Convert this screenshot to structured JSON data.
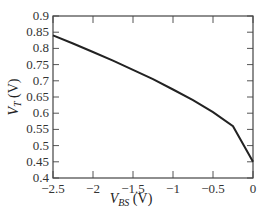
{
  "chart_data": {
    "type": "line",
    "title": "",
    "xlabel": "V_BS (V)",
    "ylabel": "V_T (V)",
    "xlim": [
      -2.5,
      0
    ],
    "ylim": [
      0.4,
      0.9
    ],
    "grid": false,
    "legend": null,
    "x_ticks": [
      "-2.5",
      "-2",
      "-1.5",
      "-1",
      "-0.5",
      "0"
    ],
    "y_ticks": [
      "0.4",
      "0.45",
      "0.5",
      "0.55",
      "0.6",
      "0.65",
      "0.7",
      "0.75",
      "0.8",
      "0.85",
      "0.9"
    ],
    "series": [
      {
        "name": "V_T",
        "x": [
          -2.5,
          -2.25,
          -2.0,
          -1.75,
          -1.5,
          -1.25,
          -1.0,
          -0.75,
          -0.5,
          -0.25,
          0
        ],
        "values": [
          0.84,
          0.815,
          0.789,
          0.762,
          0.734,
          0.705,
          0.673,
          0.64,
          0.603,
          0.56,
          0.45
        ]
      }
    ]
  },
  "axes": {
    "x_label_main": "V",
    "x_label_sub": "BS",
    "x_label_unit": " (V)",
    "y_label_main": "V",
    "y_label_sub": "T",
    "y_label_unit": " (V)"
  }
}
